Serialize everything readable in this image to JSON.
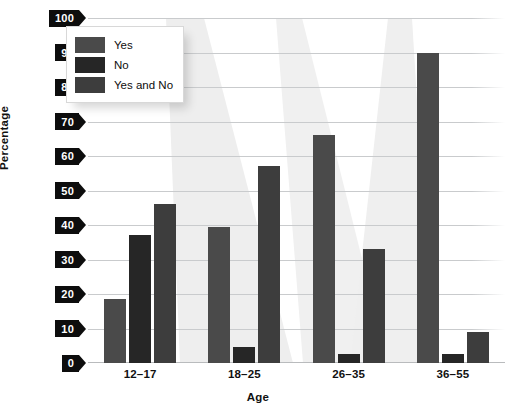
{
  "chart_data": {
    "type": "bar",
    "title": "",
    "categories": [
      "12–17",
      "18–25",
      "26–35",
      "36–55"
    ],
    "series": [
      {
        "name": "Yes",
        "values": [
          18.5,
          39.5,
          66,
          90
        ]
      },
      {
        "name": "No",
        "values": [
          37,
          4.5,
          2.5,
          2.5
        ]
      },
      {
        "name": "Yes and No",
        "values": [
          46,
          57,
          33,
          9
        ]
      }
    ],
    "xlabel": "Age",
    "ylabel": "Percentage",
    "ylim": [
      0,
      100
    ],
    "ytick_labels": [
      "0",
      "10",
      "20",
      "30",
      "40",
      "50",
      "60",
      "70",
      "80",
      "90",
      "100"
    ],
    "ytick_values": [
      0,
      10,
      20,
      30,
      40,
      50,
      60,
      70,
      80,
      90,
      100
    ],
    "grid": true,
    "legend_position": "top-left",
    "series_colors": [
      "#4a4a4a",
      "#262626",
      "#3d3d3d"
    ]
  },
  "legend": {
    "items": [
      {
        "label": "Yes",
        "swatch_color": "#4a4a4a"
      },
      {
        "label": "No",
        "swatch_color": "#262626"
      },
      {
        "label": "Yes and No",
        "swatch_color": "#3d3d3d"
      }
    ]
  },
  "axes": {
    "x_title": "Age",
    "y_title": "Percentage"
  }
}
